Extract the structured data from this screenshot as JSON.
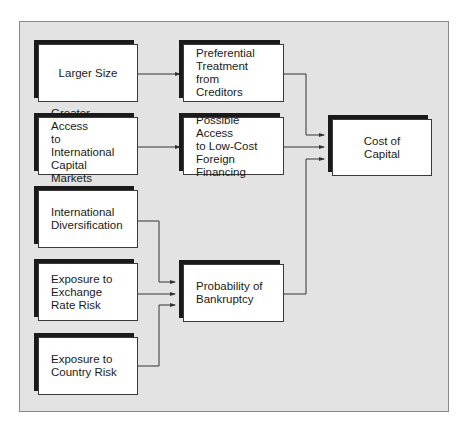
{
  "diagram": {
    "nodes": [
      {
        "id": "larger-size",
        "label": "Larger Size",
        "align": "center"
      },
      {
        "id": "preferential-treatment",
        "label": "Preferential\nTreatment from\nCreditors",
        "align": "left"
      },
      {
        "id": "greater-access",
        "label": "Greater Access\nto International\nCapital Markets",
        "align": "left"
      },
      {
        "id": "low-cost-foreign-financing",
        "label": "Possible Access\nto Low-Cost\nForeign Financing",
        "align": "left"
      },
      {
        "id": "cost-of-capital",
        "label": "Cost of Capital",
        "align": "center"
      },
      {
        "id": "international-diversification",
        "label": "International\nDiversification",
        "align": "left"
      },
      {
        "id": "exchange-rate-risk",
        "label": "Exposure to\nExchange\nRate Risk",
        "align": "left"
      },
      {
        "id": "probability-of-bankruptcy",
        "label": "Probability of\nBankruptcy",
        "align": "left"
      },
      {
        "id": "country-risk",
        "label": "Exposure to\nCountry Risk",
        "align": "left"
      }
    ],
    "edges": [
      {
        "from": "larger-size",
        "to": "preferential-treatment"
      },
      {
        "from": "greater-access",
        "to": "low-cost-foreign-financing"
      },
      {
        "from": "preferential-treatment",
        "to": "cost-of-capital"
      },
      {
        "from": "low-cost-foreign-financing",
        "to": "cost-of-capital"
      },
      {
        "from": "probability-of-bankruptcy",
        "to": "cost-of-capital"
      },
      {
        "from": "international-diversification",
        "to": "probability-of-bankruptcy"
      },
      {
        "from": "exchange-rate-risk",
        "to": "probability-of-bankruptcy"
      },
      {
        "from": "country-risk",
        "to": "probability-of-bankruptcy"
      }
    ],
    "colors": {
      "panel": "#e3e3e3",
      "box": "#ffffff",
      "shadow": "#1a1a1a",
      "line": "#333333"
    }
  }
}
